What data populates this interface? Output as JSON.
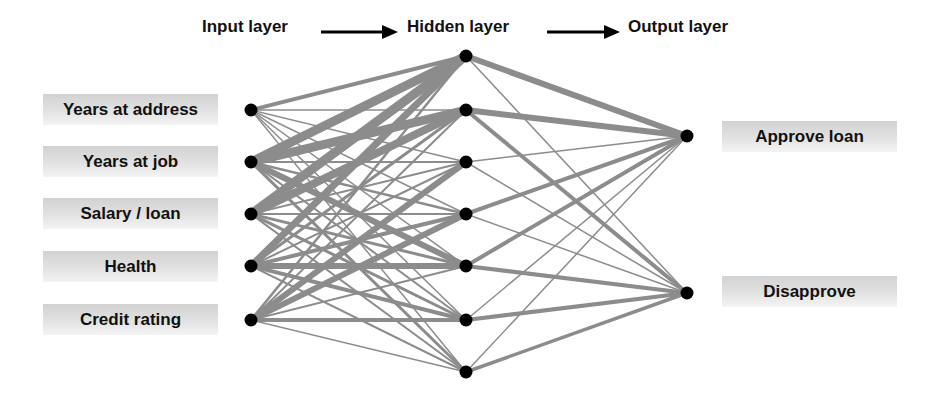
{
  "headers": {
    "input": "Input layer",
    "hidden": "Hidden layer",
    "output": "Output layer"
  },
  "inputs": [
    {
      "label": "Years at address",
      "x": 251,
      "y": 110
    },
    {
      "label": "Years at job",
      "x": 251,
      "y": 162
    },
    {
      "label": "Salary / loan",
      "x": 251,
      "y": 214
    },
    {
      "label": "Health",
      "x": 251,
      "y": 266
    },
    {
      "label": "Credit rating",
      "x": 251,
      "y": 320
    }
  ],
  "hidden": [
    {
      "x": 466,
      "y": 56
    },
    {
      "x": 466,
      "y": 110
    },
    {
      "x": 466,
      "y": 162
    },
    {
      "x": 466,
      "y": 214
    },
    {
      "x": 466,
      "y": 266
    },
    {
      "x": 466,
      "y": 320
    },
    {
      "x": 466,
      "y": 372
    }
  ],
  "outputs": [
    {
      "label": "Approve loan",
      "x": 687,
      "y": 136
    },
    {
      "label": "Disapprove",
      "x": 687,
      "y": 293
    }
  ],
  "edge_color": "#8c8c8c",
  "node_color": "#000000",
  "weights_input_hidden": [
    [
      4,
      1.5,
      1.5,
      1.5,
      1.5,
      1.5,
      1.5
    ],
    [
      9,
      9,
      2,
      2.5,
      6,
      2,
      3
    ],
    [
      9,
      8,
      2,
      2,
      3,
      3,
      2
    ],
    [
      7,
      3,
      2,
      4,
      6,
      4,
      2
    ],
    [
      2.5,
      2,
      6,
      6,
      2,
      4,
      1.5
    ]
  ],
  "weights_hidden_output": [
    [
      6,
      1.5
    ],
    [
      6,
      4
    ],
    [
      1.5,
      1.5
    ],
    [
      4,
      1.5
    ],
    [
      4,
      4
    ],
    [
      1.5,
      4
    ],
    [
      1.5,
      3.5
    ]
  ]
}
